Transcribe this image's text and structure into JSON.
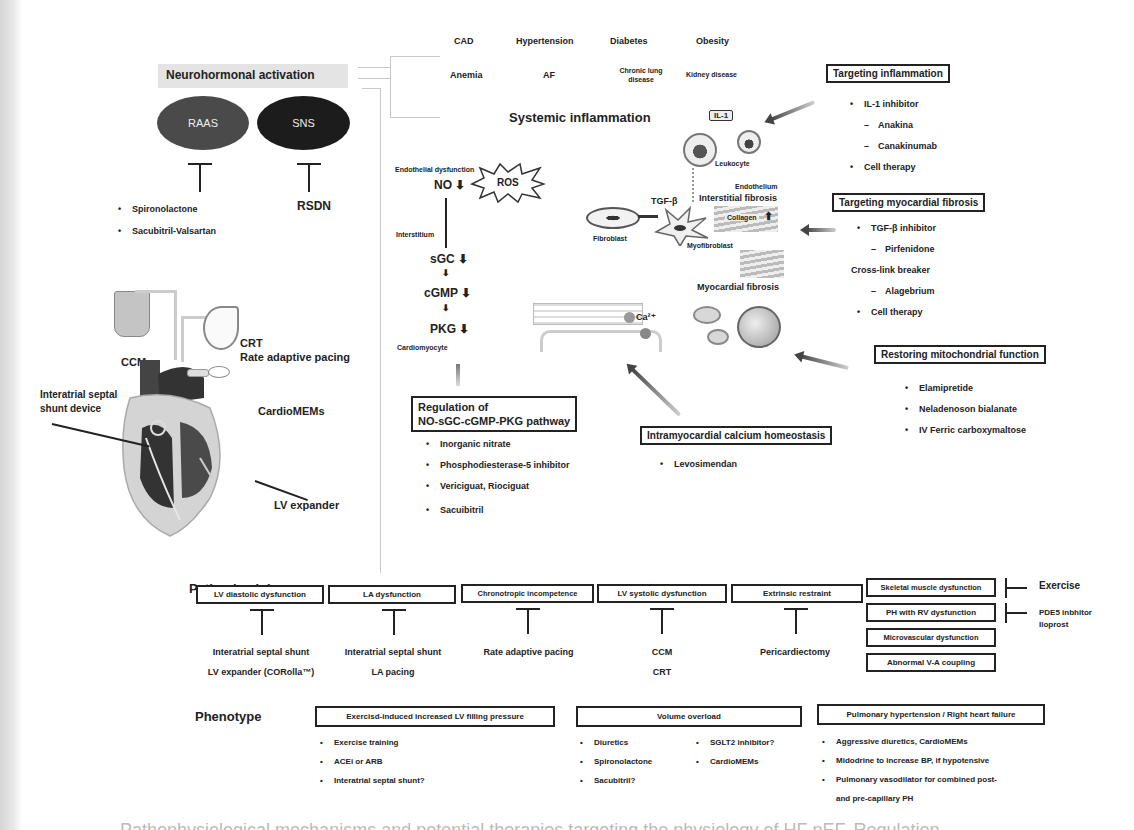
{
  "comorbidities": {
    "row1": [
      "CAD",
      "Hypertension",
      "Diabetes",
      "Obesity"
    ],
    "row2": [
      "Anemia",
      "AF",
      "Chronic lung disease",
      "Kidney disease"
    ]
  },
  "neurohormonal": {
    "title": "Neurohormonal activation",
    "raas": "RAAS",
    "sns": "SNS",
    "raas_drugs": [
      "Spironolactone",
      "Sacubitril-Valsartan"
    ],
    "sns_drug": "RSDN"
  },
  "systemic_inflammation": {
    "title": "Systemic inflammation",
    "il1_label": "IL-1",
    "leukocyte": "Leukocyte",
    "endothelium": "Endothelium",
    "interstitial_fibrosis": "Interstitial fibrosis",
    "collagen": "Collagen",
    "tgf": "TGF-β",
    "fibroblast": "Fibroblast",
    "myofibroblast": "Myofibroblast",
    "myocardial_fibrosis": "Myocardial fibrosis",
    "ca": "Ca²⁺"
  },
  "pathway": {
    "endothelial": "Endothelial dysfunction",
    "no": "NO ⬇",
    "ros": "ROS",
    "interstitium": "Interstitium",
    "sgc": "sGC ⬇",
    "cgmp": "cGMP ⬇",
    "pkg": "PKG ⬇",
    "cardiomyocyte": "Cardiomyocyte"
  },
  "targets": {
    "inflammation": {
      "title": "Targeting inflammation",
      "items": [
        {
          "type": "bullet",
          "text": "IL-1 inhibitor"
        },
        {
          "type": "dash",
          "text": "Anakina"
        },
        {
          "type": "dash",
          "text": "Canakinumab"
        },
        {
          "type": "bullet",
          "text": "Cell therapy"
        }
      ]
    },
    "fibrosis": {
      "title": "Targeting  myocardial fibrosis",
      "items": [
        {
          "type": "bullet",
          "text": "TGF-β inhibitor"
        },
        {
          "type": "dash",
          "text": "Pirfenidone"
        },
        {
          "type": "plain",
          "text": "Cross-link breaker"
        },
        {
          "type": "dash",
          "text": "Alagebrium"
        },
        {
          "type": "bullet",
          "text": "Cell therapy"
        }
      ]
    },
    "mitochondrial": {
      "title": "Restoring mitochondrial function",
      "items": [
        "Elamipretide",
        "Neladenoson bialanate",
        "IV Ferric carboxymaltose"
      ]
    },
    "calcium": {
      "title": "Intramyocardial calcium homeostasis",
      "items": [
        "Levosimendan"
      ]
    },
    "no_pathway": {
      "title_line1": "Regulation of",
      "title_line2": "NO-sGC-cGMP-PKG pathway",
      "items": [
        "Inorganic nitrate",
        "Phosphodiesterase-5 inhibitor",
        "Vericiguat, Riociguat",
        "Sacuibitril"
      ]
    }
  },
  "devices": {
    "ccm": "CCM",
    "crt": "CRT",
    "rate_pacing": "Rate adaptive pacing",
    "shunt_line1": "Interatrial septal",
    "shunt_line2": "shunt device",
    "cardiomems": "CardioMEMs",
    "lv_expander": "LV expander"
  },
  "pathophysiology": {
    "title": "Pathophysiology",
    "columns": [
      {
        "box": "LV diastolic dysfunction",
        "therapies": [
          "Interatrial septal shunt",
          "LV expander (CORolla™)"
        ]
      },
      {
        "box": "LA dysfunction",
        "therapies": [
          "Interatrial septal shunt",
          "LA pacing"
        ]
      },
      {
        "box": "Chronotropic incompetence",
        "therapies": [
          "Rate adaptive pacing"
        ]
      },
      {
        "box": "LV systolic dysfunction",
        "therapies": [
          "CCM",
          "CRT"
        ]
      },
      {
        "box": "Extrinsic restraint",
        "therapies": [
          "Pericardiectomy"
        ]
      }
    ],
    "stack": [
      {
        "box": "Skeletal muscle dysfunction",
        "therapy": "Exercise"
      },
      {
        "box": "PH with RV dysfunction",
        "therapy_line1": "PDE5 inbhitor",
        "therapy_line2": "Iloprost"
      },
      {
        "box": "Microvascular dysfunction"
      },
      {
        "box": "Abnormal V-A coupling"
      }
    ]
  },
  "phenotype": {
    "title": "Phenotype",
    "groups": [
      {
        "box": "Exercisd-induced increased LV filling pressure",
        "items": [
          "Exercise training",
          "ACEi or ARB",
          "Interatrial septal shunt?"
        ]
      },
      {
        "box": "Volume overload",
        "items_col1": [
          "Diuretics",
          "Spironolactone",
          "Sacubitril?"
        ],
        "items_col2": [
          "SGLT2 inhibitor?",
          "CardioMEMs"
        ]
      },
      {
        "box": "Pulmonary hypertension / Right heart failure",
        "items": [
          "Aggressive diuretics, CardioMEMs",
          "Midodrine to increase BP, if hypotensive",
          "Pulmonary vasodilator for combined post-"
        ],
        "continuation": "and pre-capillary PH"
      }
    ]
  },
  "caption": "Pathophysiological mechanisms and potential therapies targeting the physiology of HF pEF. Regulation"
}
